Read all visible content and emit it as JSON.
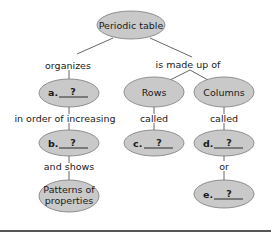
{
  "diagram": {
    "type": "concept-map",
    "colors": {
      "node_fill": "#c9c9c9",
      "node_stroke": "#7a7a7a",
      "line": "#555555",
      "bottom_rule": "#555555"
    },
    "nodes": {
      "root": {
        "label": "Periodic table"
      },
      "a": {
        "letter": "a.",
        "blank": "?"
      },
      "b": {
        "letter": "b.",
        "blank": "?"
      },
      "patterns": {
        "line1": "Patterns of",
        "line2": "properties"
      },
      "rows": {
        "label": "Rows"
      },
      "columns": {
        "label": "Columns"
      },
      "c": {
        "letter": "c.",
        "blank": "?"
      },
      "d": {
        "letter": "d.",
        "blank": "?"
      },
      "e": {
        "letter": "e.",
        "blank": "?"
      }
    },
    "links": {
      "organizes": "organizes",
      "made_up_of": "is made up of",
      "increasing": "in order of increasing",
      "and_shows": "and shows",
      "rows_called": "called",
      "columns_called": "called",
      "or": "or"
    }
  }
}
